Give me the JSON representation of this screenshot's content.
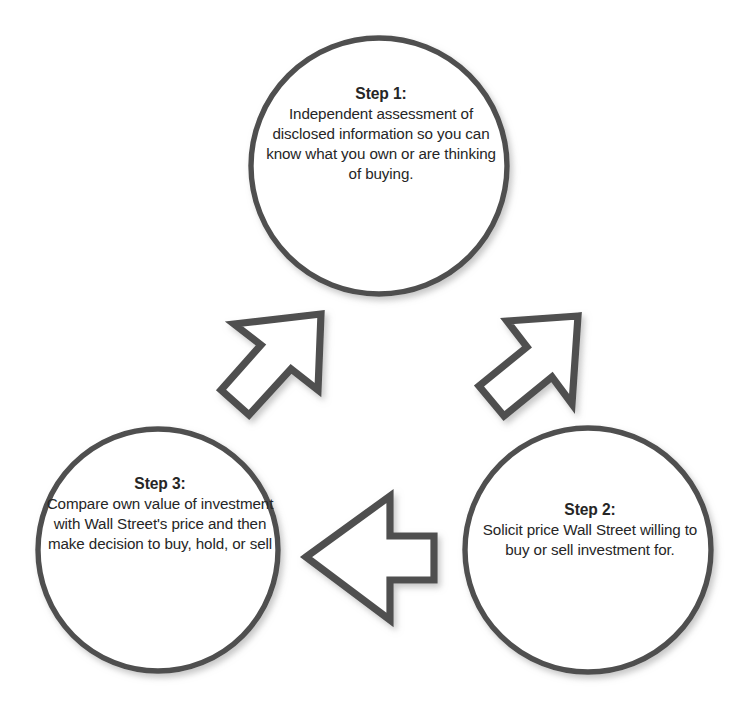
{
  "diagram": {
    "type": "cycle",
    "title": "",
    "background_color": "#ffffff",
    "stroke_color": "#4a4a4a",
    "text_color": "#262626",
    "nodes": [
      {
        "id": "step1",
        "title": "Step 1:",
        "body": "Independent assessment of disclosed information so you can know what you own or are thinking of buying.",
        "shape": "circle",
        "center_x": 379,
        "center_y": 166,
        "radius": 128
      },
      {
        "id": "step2",
        "title": "Step 2:",
        "body": "Solicit price Wall Street willing to buy or sell investment for.",
        "shape": "circle",
        "center_x": 588,
        "center_y": 550,
        "radius": 123
      },
      {
        "id": "step3",
        "title": "Step 3:",
        "body": "Compare own value of investment with Wall Street's price and then make decision to buy, hold, or sell",
        "shape": "circle",
        "center_x": 158,
        "center_y": 550,
        "radius": 120
      }
    ],
    "arrows": [
      {
        "id": "arrow-step3-to-step1",
        "from": "step3",
        "to": "step1",
        "direction": "up-right",
        "label": ""
      },
      {
        "id": "arrow-step1-to-step2",
        "from": "step1",
        "to": "step2",
        "direction": "down-right",
        "label": ""
      },
      {
        "id": "arrow-step2-to-step3",
        "from": "step2",
        "to": "step3",
        "direction": "left",
        "label": ""
      }
    ]
  }
}
